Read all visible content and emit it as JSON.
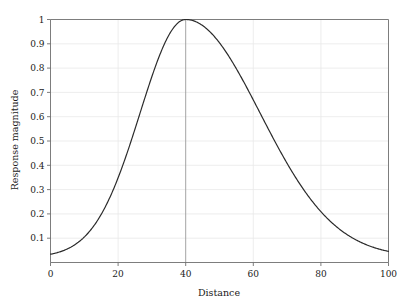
{
  "chart_data": {
    "type": "line",
    "title": "",
    "xlabel": "Distance",
    "ylabel": "Response magnitude",
    "xlim": [
      0,
      100
    ],
    "ylim": [
      0,
      1
    ],
    "xticks": [
      0,
      20,
      40,
      60,
      80,
      100
    ],
    "xtick_labels": [
      "0",
      "20",
      "40",
      "60",
      "80",
      "100"
    ],
    "yticks": [
      0.1,
      0.2,
      0.3,
      0.4,
      0.5,
      0.6,
      0.7,
      0.8,
      0.9,
      1
    ],
    "ytick_labels": [
      "0.1",
      "0.2",
      "0.3",
      "0.4",
      "0.5",
      "0.6",
      "0.7",
      "0.8",
      "0.9",
      "1"
    ],
    "grid": true,
    "grid_color": "#e8e8e8",
    "grid_emphasis_x": 40,
    "legend": false,
    "line_color": "#2b2b2b",
    "line_width": 1.2,
    "peak_x": 40,
    "peak_y": 1,
    "series": [
      {
        "name": "Response magnitude",
        "x": [
          0,
          2,
          4,
          6,
          8,
          10,
          12,
          14,
          16,
          18,
          20,
          22,
          24,
          26,
          28,
          30,
          32,
          34,
          36,
          38,
          40,
          42,
          44,
          46,
          48,
          50,
          52,
          54,
          56,
          58,
          60,
          62,
          64,
          66,
          68,
          70,
          72,
          74,
          76,
          78,
          80,
          82,
          84,
          86,
          88,
          90,
          92,
          94,
          96,
          98,
          100
        ],
        "y": [
          0.022,
          0.033,
          0.047,
          0.067,
          0.093,
          0.126,
          0.168,
          0.219,
          0.28,
          0.35,
          0.428,
          0.512,
          0.598,
          0.683,
          0.762,
          0.831,
          0.888,
          0.933,
          0.965,
          0.986,
          1.0,
          0.996,
          0.984,
          0.964,
          0.937,
          0.903,
          0.864,
          0.82,
          0.773,
          0.723,
          0.672,
          0.62,
          0.569,
          0.519,
          0.47,
          0.423,
          0.379,
          0.338,
          0.299,
          0.264,
          0.231,
          0.202,
          0.175,
          0.151,
          0.13,
          0.111,
          0.095,
          0.081,
          0.068,
          0.058,
          0.145
        ]
      }
    ]
  },
  "axes": {
    "x_label": "Distance",
    "y_label": "Response magnitude"
  }
}
